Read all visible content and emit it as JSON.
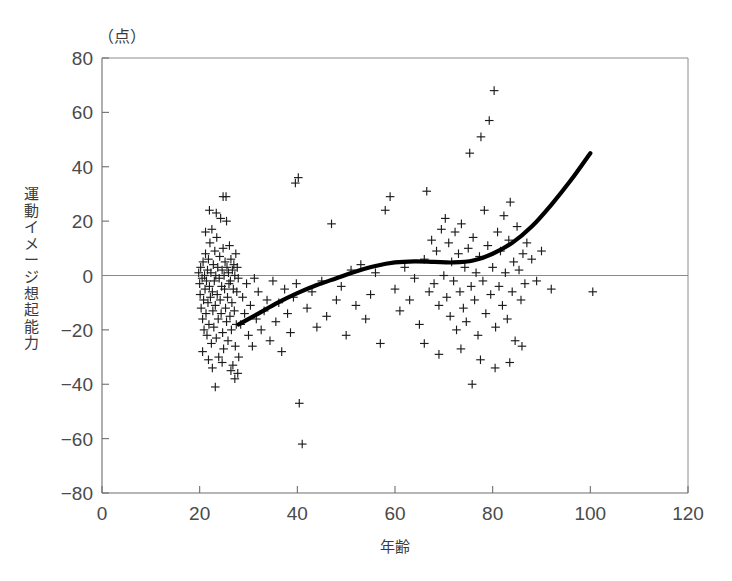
{
  "figure": {
    "unit_label": "（点）",
    "x_axis_title": "年齢",
    "y_axis_title": "運動イメージ想起能力"
  },
  "chart_data": {
    "type": "scatter",
    "title": "",
    "subtitle": "",
    "xlabel": "年齢",
    "ylabel": "運動イメージ想起能力",
    "unit": "（点）",
    "xlim": [
      0,
      120
    ],
    "ylim": [
      -80,
      80
    ],
    "xticks": [
      0,
      20,
      40,
      60,
      80,
      100,
      120
    ],
    "yticks": [
      -80,
      -60,
      -40,
      -20,
      0,
      20,
      40,
      60,
      80
    ],
    "grid": false,
    "legend": null,
    "marker": "plus",
    "marker_color": "#1c1c1c",
    "zero_line": 0,
    "series": [
      {
        "name": "個人データ",
        "type": "scatter",
        "points": [
          [
            19.8,
            1
          ],
          [
            20.0,
            -3
          ],
          [
            20.1,
            -7
          ],
          [
            20.2,
            3
          ],
          [
            20.3,
            -12
          ],
          [
            20.5,
            -1
          ],
          [
            20.6,
            -16
          ],
          [
            20.7,
            5
          ],
          [
            20.8,
            -9
          ],
          [
            20.9,
            -20
          ],
          [
            21.0,
            0
          ],
          [
            21.1,
            -5
          ],
          [
            21.2,
            8
          ],
          [
            21.3,
            -14
          ],
          [
            21.4,
            -2
          ],
          [
            21.5,
            -22
          ],
          [
            21.6,
            2
          ],
          [
            21.7,
            -10
          ],
          [
            21.8,
            6
          ],
          [
            21.9,
            -18
          ],
          [
            22.0,
            -4
          ],
          [
            22.1,
            12
          ],
          [
            22.2,
            -8
          ],
          [
            22.3,
            1
          ],
          [
            22.4,
            -25
          ],
          [
            22.5,
            17
          ],
          [
            22.6,
            -6
          ],
          [
            22.7,
            -13
          ],
          [
            22.8,
            4
          ],
          [
            22.9,
            -19
          ],
          [
            23.0,
            -2
          ],
          [
            23.1,
            9
          ],
          [
            23.2,
            -11
          ],
          [
            23.3,
            0
          ],
          [
            23.4,
            -23
          ],
          [
            23.5,
            14
          ],
          [
            23.6,
            -7
          ],
          [
            23.7,
            3
          ],
          [
            23.8,
            -16
          ],
          [
            23.9,
            -30
          ],
          [
            24.0,
            -1
          ],
          [
            24.1,
            7
          ],
          [
            24.2,
            -9
          ],
          [
            24.3,
            21
          ],
          [
            24.4,
            -14
          ],
          [
            24.5,
            -4
          ],
          [
            24.6,
            2
          ],
          [
            24.7,
            -21
          ],
          [
            24.8,
            10
          ],
          [
            24.9,
            -27
          ],
          [
            25.0,
            0
          ],
          [
            25.1,
            -5
          ],
          [
            25.2,
            5
          ],
          [
            25.3,
            -12
          ],
          [
            25.4,
            29
          ],
          [
            25.5,
            -17
          ],
          [
            25.6,
            3
          ],
          [
            25.7,
            -8
          ],
          [
            25.8,
            -24
          ],
          [
            25.9,
            1
          ],
          [
            26.0,
            -3
          ],
          [
            26.1,
            11
          ],
          [
            26.2,
            -15
          ],
          [
            26.3,
            -2
          ],
          [
            26.4,
            6
          ],
          [
            26.5,
            -20
          ],
          [
            26.6,
            -10
          ],
          [
            26.7,
            2
          ],
          [
            26.8,
            -33
          ],
          [
            26.9,
            -5
          ],
          [
            27.0,
            4
          ],
          [
            27.1,
            -13
          ],
          [
            27.2,
            0
          ],
          [
            27.3,
            -26
          ],
          [
            27.4,
            8
          ],
          [
            27.5,
            -18
          ],
          [
            27.6,
            -6
          ],
          [
            27.7,
            3
          ],
          [
            27.8,
            -36
          ],
          [
            27.9,
            -1
          ],
          [
            21.2,
            16
          ],
          [
            22.0,
            24
          ],
          [
            23.4,
            23
          ],
          [
            24.8,
            29
          ],
          [
            25.5,
            20
          ],
          [
            20.6,
            -28
          ],
          [
            21.8,
            -31
          ],
          [
            22.6,
            -34
          ],
          [
            23.2,
            -41
          ],
          [
            24.6,
            -32
          ],
          [
            26.4,
            -35
          ],
          [
            27.2,
            -38
          ],
          [
            28.0,
            -30
          ],
          [
            28.4,
            -18
          ],
          [
            28.8,
            -8
          ],
          [
            29.2,
            -14
          ],
          [
            29.6,
            -3
          ],
          [
            30.0,
            -22
          ],
          [
            30.4,
            -11
          ],
          [
            30.8,
            -26
          ],
          [
            31.2,
            -1
          ],
          [
            31.6,
            -16
          ],
          [
            32.0,
            -6
          ],
          [
            32.6,
            -20
          ],
          [
            33.2,
            -13
          ],
          [
            33.8,
            -9
          ],
          [
            34.4,
            -24
          ],
          [
            35.0,
            -2
          ],
          [
            35.6,
            -17
          ],
          [
            36.2,
            -10
          ],
          [
            36.8,
            -28
          ],
          [
            37.4,
            -5
          ],
          [
            38.0,
            -14
          ],
          [
            38.6,
            -21
          ],
          [
            39.2,
            -8
          ],
          [
            39.8,
            -3
          ],
          [
            40.4,
            -47
          ],
          [
            40.2,
            36
          ],
          [
            39.6,
            34
          ],
          [
            41.0,
            -62
          ],
          [
            42.0,
            -12
          ],
          [
            43.0,
            -6
          ],
          [
            44.0,
            -19
          ],
          [
            45.0,
            -2
          ],
          [
            46.0,
            -15
          ],
          [
            47.0,
            19
          ],
          [
            48.0,
            -9
          ],
          [
            49.0,
            -4
          ],
          [
            50.0,
            -22
          ],
          [
            51.0,
            2
          ],
          [
            52.0,
            -11
          ],
          [
            53.0,
            4
          ],
          [
            54.0,
            -16
          ],
          [
            55.0,
            -7
          ],
          [
            56.0,
            1
          ],
          [
            57.0,
            -25
          ],
          [
            58.0,
            24
          ],
          [
            59.0,
            29
          ],
          [
            60.0,
            -5
          ],
          [
            61.0,
            -13
          ],
          [
            62.0,
            3
          ],
          [
            63.0,
            -9
          ],
          [
            64.0,
            -1
          ],
          [
            65.0,
            -18
          ],
          [
            66.0,
            6
          ],
          [
            66.5,
            31
          ],
          [
            67.0,
            -6
          ],
          [
            67.5,
            13
          ],
          [
            68.0,
            -3
          ],
          [
            68.5,
            9
          ],
          [
            69.0,
            -11
          ],
          [
            69.5,
            17
          ],
          [
            70.0,
            0
          ],
          [
            70.3,
            21
          ],
          [
            70.6,
            -8
          ],
          [
            71.0,
            12
          ],
          [
            71.3,
            -15
          ],
          [
            71.6,
            5
          ],
          [
            72.0,
            -2
          ],
          [
            72.3,
            16
          ],
          [
            72.6,
            -20
          ],
          [
            73.0,
            8
          ],
          [
            73.3,
            -6
          ],
          [
            73.6,
            19
          ],
          [
            74.0,
            -12
          ],
          [
            74.3,
            3
          ],
          [
            74.6,
            -17
          ],
          [
            75.0,
            10
          ],
          [
            75.3,
            45
          ],
          [
            75.6,
            -4
          ],
          [
            76.0,
            14
          ],
          [
            76.3,
            -9
          ],
          [
            76.6,
            1
          ],
          [
            77.0,
            -22
          ],
          [
            77.3,
            7
          ],
          [
            77.6,
            51
          ],
          [
            78.0,
            -2
          ],
          [
            78.3,
            24
          ],
          [
            78.6,
            -14
          ],
          [
            79.0,
            11
          ],
          [
            79.3,
            57
          ],
          [
            79.6,
            -7
          ],
          [
            80.0,
            3
          ],
          [
            80.3,
            68
          ],
          [
            80.6,
            -19
          ],
          [
            81.0,
            16
          ],
          [
            81.3,
            -4
          ],
          [
            81.6,
            9
          ],
          [
            82.0,
            -11
          ],
          [
            82.3,
            22
          ],
          [
            82.6,
            1
          ],
          [
            83.0,
            -16
          ],
          [
            83.3,
            13
          ],
          [
            83.6,
            27
          ],
          [
            84.0,
            -6
          ],
          [
            84.3,
            5
          ],
          [
            84.6,
            -24
          ],
          [
            85.0,
            18
          ],
          [
            85.4,
            2
          ],
          [
            85.8,
            -9
          ],
          [
            86.2,
            8
          ],
          [
            86.6,
            -3
          ],
          [
            87.0,
            12
          ],
          [
            75.8,
            -40
          ],
          [
            77.5,
            -31
          ],
          [
            80.5,
            -34
          ],
          [
            83.5,
            -32
          ],
          [
            86.0,
            -26
          ],
          [
            69.0,
            -29
          ],
          [
            66.0,
            -25
          ],
          [
            73.5,
            -27
          ],
          [
            88.0,
            6
          ],
          [
            89.0,
            -2
          ],
          [
            90.0,
            9
          ],
          [
            92.0,
            -5
          ],
          [
            100.5,
            -6
          ]
        ]
      },
      {
        "name": "平滑化回帰曲線",
        "type": "line",
        "points": [
          [
            28,
            -18
          ],
          [
            32,
            -14
          ],
          [
            36,
            -10
          ],
          [
            40,
            -6.5
          ],
          [
            44,
            -3.5
          ],
          [
            48,
            -1
          ],
          [
            52,
            1.5
          ],
          [
            56,
            3.5
          ],
          [
            60,
            4.8
          ],
          [
            64,
            5.2
          ],
          [
            68,
            5.0
          ],
          [
            72,
            4.8
          ],
          [
            76,
            5.5
          ],
          [
            80,
            8
          ],
          [
            84,
            12
          ],
          [
            88,
            18
          ],
          [
            92,
            26
          ],
          [
            96,
            35
          ],
          [
            100,
            45
          ]
        ]
      }
    ]
  }
}
